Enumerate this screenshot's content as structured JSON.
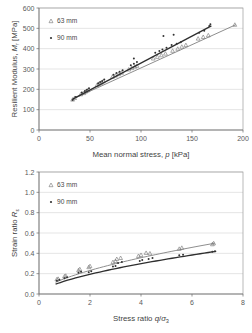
{
  "chart_data": [
    {
      "type": "scatter",
      "title": "",
      "xlabel": "Mean normal stress, p [kPa]",
      "xlabel_parts": {
        "pre": "Mean normal stress, ",
        "italic": "p",
        "post": " [kPa]"
      },
      "ylabel": "Resilient Modulus, Mr [MPa]",
      "ylabel_parts": {
        "pre": "Resilient Modulus, ",
        "italic": "M",
        "sub": "r",
        "post": " [MPa]"
      },
      "xlim": [
        0,
        200
      ],
      "ylim": [
        0,
        600
      ],
      "xticks": [
        0,
        50,
        100,
        150,
        200
      ],
      "yticks": [
        0,
        100,
        200,
        300,
        400,
        500,
        600
      ],
      "grid": "horizontal",
      "legend_position": "top-left",
      "series": [
        {
          "name": "63 mm",
          "marker": "open-triangle",
          "color": "#8e8e8e",
          "points": [
            [
              33,
              150
            ],
            [
              35,
              158
            ],
            [
              41,
              176
            ],
            [
              44,
              182
            ],
            [
              46,
              190
            ],
            [
              48,
              196
            ],
            [
              57,
              222
            ],
            [
              59,
              228
            ],
            [
              61,
              233
            ],
            [
              63,
              240
            ],
            [
              72,
              262
            ],
            [
              75,
              268
            ],
            [
              78,
              275
            ],
            [
              81,
              282
            ],
            [
              88,
              298
            ],
            [
              91,
              305
            ],
            [
              94,
              312
            ],
            [
              96,
              316
            ],
            [
              112,
              352
            ],
            [
              116,
              360
            ],
            [
              120,
              368
            ],
            [
              124,
              376
            ],
            [
              131,
              390
            ],
            [
              136,
              400
            ],
            [
              140,
              410
            ],
            [
              144,
              418
            ],
            [
              156,
              450
            ],
            [
              161,
              458
            ],
            [
              166,
              466
            ],
            [
              192,
              518
            ]
          ],
          "trend_from": [
            33,
            152
          ],
          "trend_to": [
            193,
            518
          ]
        },
        {
          "name": "90 mm",
          "marker": "filled-diamond",
          "color": "#2e2e2e",
          "points": [
            [
              33,
              148
            ],
            [
              36,
              162
            ],
            [
              42,
              185
            ],
            [
              45,
              192
            ],
            [
              47,
              198
            ],
            [
              49,
              205
            ],
            [
              58,
              230
            ],
            [
              60,
              236
            ],
            [
              62,
              241
            ],
            [
              64,
              248
            ],
            [
              73,
              272
            ],
            [
              76,
              280
            ],
            [
              79,
              286
            ],
            [
              82,
              294
            ],
            [
              90,
              318
            ],
            [
              93,
              326
            ],
            [
              93,
              352
            ],
            [
              96,
              334
            ],
            [
              114,
              380
            ],
            [
              118,
              388
            ],
            [
              121,
              396
            ],
            [
              122,
              462
            ],
            [
              125,
              404
            ],
            [
              130,
              418
            ],
            [
              132,
              468
            ],
            [
              135,
              424
            ],
            [
              139,
              432
            ],
            [
              157,
              478
            ],
            [
              162,
              488
            ],
            [
              167,
              512
            ],
            [
              168,
              520
            ]
          ],
          "trend_from": [
            33,
            152
          ],
          "trend_to": [
            169,
            512
          ]
        }
      ]
    },
    {
      "type": "scatter",
      "title": "",
      "xlabel": "Stress ratio q/σ₃",
      "xlabel_parts": {
        "pre": "Stress ratio ",
        "italic": "q",
        "post": "/",
        "sym": "σ",
        "sub": "3"
      },
      "ylabel": "Strain ratio Rε",
      "ylabel_parts": {
        "pre": "Strain ratio ",
        "italic": "R",
        "sub": "ε"
      },
      "xlim": [
        0,
        8
      ],
      "ylim": [
        0.0,
        1.2
      ],
      "xticks": [
        0,
        2,
        4,
        6,
        8
      ],
      "yticks": [
        0.0,
        0.2,
        0.4,
        0.6,
        0.8,
        1.0,
        1.2
      ],
      "grid": "horizontal",
      "legend_position": "top-left",
      "series": [
        {
          "name": "63 mm",
          "marker": "open-triangle",
          "color": "#8e8e8e",
          "points": [
            [
              0.7,
              0.145
            ],
            [
              0.75,
              0.15
            ],
            [
              1.0,
              0.175
            ],
            [
              1.05,
              0.18
            ],
            [
              1.55,
              0.235
            ],
            [
              1.6,
              0.245
            ],
            [
              1.95,
              0.265
            ],
            [
              2.0,
              0.275
            ],
            [
              2.9,
              0.315
            ],
            [
              3.0,
              0.325
            ],
            [
              3.05,
              0.345
            ],
            [
              3.2,
              0.355
            ],
            [
              3.9,
              0.375
            ],
            [
              4.0,
              0.385
            ],
            [
              4.2,
              0.405
            ],
            [
              4.35,
              0.4
            ],
            [
              5.5,
              0.445
            ],
            [
              5.6,
              0.455
            ],
            [
              6.8,
              0.49
            ],
            [
              6.85,
              0.5
            ]
          ],
          "trend_from": [
            0.65,
            0.14
          ],
          "trend_to": [
            6.9,
            0.5
          ]
        },
        {
          "name": "90 mm",
          "marker": "filled-diamond",
          "color": "#2e2e2e",
          "points": [
            [
              0.7,
              0.13
            ],
            [
              0.8,
              0.14
            ],
            [
              1.0,
              0.155
            ],
            [
              1.1,
              0.165
            ],
            [
              1.55,
              0.21
            ],
            [
              1.65,
              0.22
            ],
            [
              1.95,
              0.215
            ],
            [
              2.05,
              0.225
            ],
            [
              2.9,
              0.27
            ],
            [
              3.0,
              0.275
            ],
            [
              3.1,
              0.305
            ],
            [
              3.25,
              0.315
            ],
            [
              3.95,
              0.325
            ],
            [
              4.05,
              0.335
            ],
            [
              4.3,
              0.345
            ],
            [
              4.45,
              0.355
            ],
            [
              5.5,
              0.38
            ],
            [
              5.65,
              0.385
            ],
            [
              6.8,
              0.415
            ],
            [
              6.9,
              0.42
            ]
          ],
          "trend_from": [
            0.65,
            0.125
          ],
          "trend_to": [
            6.95,
            0.42
          ]
        }
      ]
    }
  ],
  "charts": [
    {
      "legend": [
        {
          "label": "63 mm",
          "marker": "open-triangle"
        },
        {
          "label": "90 mm",
          "marker": "filled-diamond"
        }
      ]
    },
    {
      "legend": [
        {
          "label": "63 mm",
          "marker": "open-triangle"
        },
        {
          "label": "90 mm",
          "marker": "filled-diamond"
        }
      ]
    }
  ]
}
